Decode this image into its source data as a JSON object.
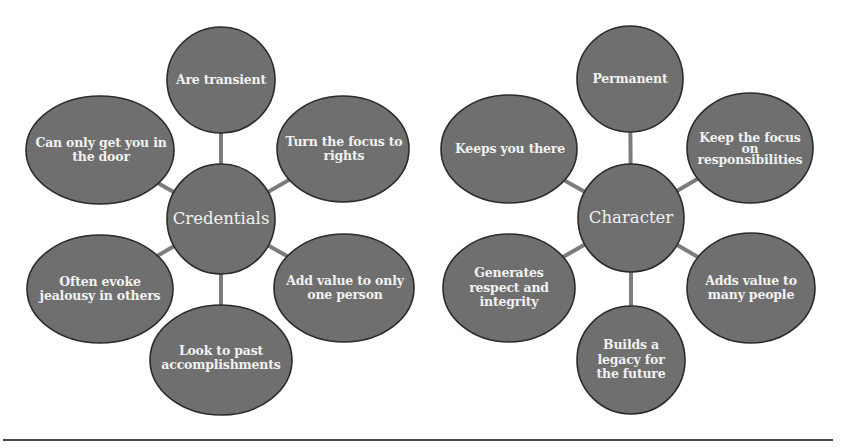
{
  "diagrams": [
    {
      "center": "Credentials",
      "nodes": [
        "Are transient",
        "Turn the focus to rights",
        "Add value to only one person",
        "Look to past accomplishments",
        "Often evoke jealousy in others",
        "Can only get you in the door"
      ]
    },
    {
      "center": "Character",
      "nodes": [
        "Permanent",
        "Keep the focus on responsibilities",
        "Adds value to many people",
        "Builds a legacy for the future",
        "Generates respect and integrity",
        "Keeps you there"
      ]
    }
  ],
  "colors": {
    "node_fill": "#6f6f6f",
    "node_stroke": "#2b2b2b",
    "connector": "#7c7c7c",
    "text": "#f1f1f1"
  }
}
